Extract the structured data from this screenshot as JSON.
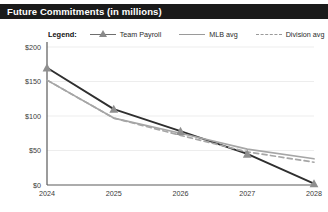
{
  "titlebar": {
    "title": "Future Commitments (in millions)"
  },
  "legend": {
    "label": "Legend:",
    "items": [
      {
        "name": "Team Payroll",
        "style": "line-marker",
        "color": "#3a3a3a"
      },
      {
        "name": "MLB avg",
        "style": "line",
        "color": "#a6a6a6"
      },
      {
        "name": "Division avg",
        "style": "dashed",
        "color": "#a6a6a6"
      }
    ]
  },
  "chart_data": {
    "type": "line",
    "title": "Future Commitments (in millions)",
    "xlabel": "",
    "ylabel": "",
    "x": [
      "2024",
      "2025",
      "2026",
      "2027",
      "2028"
    ],
    "categories": [
      "2024",
      "2025",
      "2026",
      "2027",
      "2028"
    ],
    "ytick_labels": [
      "$0",
      "$50",
      "$100",
      "$150",
      "$200"
    ],
    "ytick_values": [
      0,
      50,
      100,
      150,
      200
    ],
    "ylim": [
      0,
      200
    ],
    "grid": true,
    "legend_position": "top",
    "series": [
      {
        "name": "Team Payroll",
        "color": "#2f2f2f",
        "style": "solid",
        "marker": "triangle",
        "values": [
          170,
          110,
          78,
          45,
          2
        ]
      },
      {
        "name": "MLB avg",
        "color": "#a6a6a6",
        "style": "solid",
        "marker": "none",
        "values": [
          152,
          97,
          75,
          52,
          38
        ]
      },
      {
        "name": "Division avg",
        "color": "#a6a6a6",
        "style": "dashed",
        "marker": "none",
        "values": [
          152,
          97,
          72,
          48,
          33
        ]
      }
    ]
  }
}
